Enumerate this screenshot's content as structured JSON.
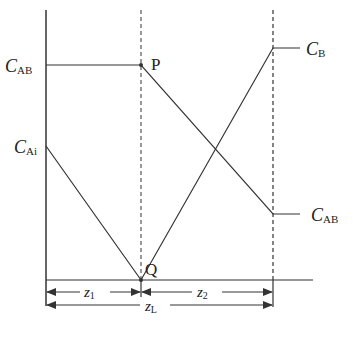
{
  "diagram": {
    "labels": {
      "c_ab_left": {
        "main": "C",
        "sub": "AB"
      },
      "c_ai": {
        "main": "C",
        "sub": "Ai"
      },
      "c_b": {
        "main": "C",
        "sub": "B"
      },
      "c_ab_right": {
        "main": "C",
        "sub": "AB"
      },
      "point_p": "P",
      "point_q": "Q",
      "z1": {
        "main": "z",
        "sub": "1"
      },
      "z2": {
        "main": "z",
        "sub": "2"
      },
      "zl": {
        "main": "z",
        "sub": "L"
      }
    },
    "colors": {
      "line": "#333333",
      "background": "#ffffff"
    }
  }
}
